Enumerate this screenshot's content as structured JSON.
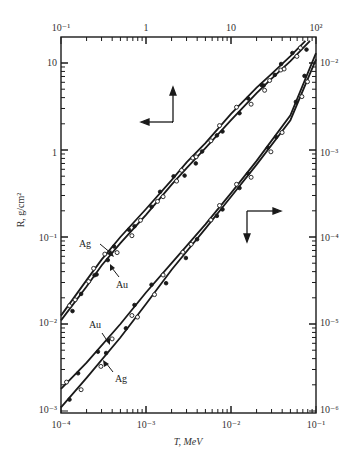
{
  "chart_data": {
    "type": "line",
    "title": "",
    "xlabel_top": "",
    "xlabel_bottom": "T, MeV",
    "ylabel_left": "R, g/cm²",
    "ylabel_right": "",
    "scale": "log-log",
    "grid": false,
    "axes": {
      "top_x": {
        "range": [
          0.1,
          100
        ],
        "ticks": [
          "10⁻¹",
          "1",
          "10",
          "10²"
        ]
      },
      "bottom_x": {
        "range": [
          0.0001,
          0.1
        ],
        "ticks": [
          "10⁻⁴",
          "10⁻³",
          "10⁻²",
          "10⁻¹"
        ]
      },
      "left_y": {
        "range": [
          0.001,
          20
        ],
        "ticks": [
          "10⁻³",
          "10⁻²",
          "10⁻¹",
          "1",
          "10"
        ]
      },
      "right_y": {
        "range": [
          1e-06,
          0.02
        ],
        "ticks": [
          "10⁻⁶",
          "10⁻⁵",
          "10⁻⁴",
          "10⁻³",
          "10⁻²"
        ]
      }
    },
    "axis_indicators": [
      {
        "group": "high-energy",
        "points_to": [
          "left axis",
          "top axis"
        ]
      },
      {
        "group": "low-energy",
        "points_to": [
          "right axis",
          "bottom axis"
        ]
      }
    ],
    "series": [
      {
        "name": "Ag (high energy)",
        "axes": "top-left",
        "label": "Ag",
        "x": [
          0.1,
          0.2,
          0.3,
          0.5,
          1,
          2,
          3,
          5,
          10,
          20,
          30,
          50,
          75
        ],
        "y": [
          0.0125,
          0.032,
          0.055,
          0.1,
          0.21,
          0.45,
          0.72,
          1.2,
          2.6,
          5.2,
          7.5,
          12,
          18
        ]
      },
      {
        "name": "Au (high energy)",
        "axes": "top-left",
        "label": "Au",
        "x": [
          0.1,
          0.2,
          0.3,
          0.5,
          1,
          2,
          3,
          5,
          10,
          20,
          30,
          50,
          85
        ],
        "y": [
          0.011,
          0.027,
          0.047,
          0.085,
          0.18,
          0.4,
          0.62,
          1.05,
          2.2,
          4.5,
          6.6,
          10.5,
          18
        ]
      },
      {
        "name": "Au (low energy)",
        "axes": "bottom-right",
        "label": "Au",
        "x": [
          0.0001,
          0.0002,
          0.0005,
          0.001,
          0.002,
          0.005,
          0.01,
          0.02,
          0.05,
          0.1
        ],
        "y": [
          1.8e-06,
          3.6e-06,
          1e-05,
          2.3e-05,
          5e-05,
          0.00014,
          0.00032,
          0.00075,
          0.0025,
          0.013
        ]
      },
      {
        "name": "Ag (low energy)",
        "axes": "bottom-right",
        "label": "Ag",
        "x": [
          0.0001,
          0.0002,
          0.0005,
          0.001,
          0.002,
          0.005,
          0.01,
          0.02,
          0.05,
          0.1
        ],
        "y": [
          1.1e-06,
          2.4e-06,
          7e-06,
          1.7e-05,
          4.2e-05,
          0.000125,
          0.00029,
          0.00068,
          0.0022,
          0.011
        ]
      }
    ],
    "annotations": [
      "Ag",
      "Au",
      "Au",
      "Ag"
    ],
    "experimental_points": "open and filled circles scattered along both curve pairs"
  },
  "labels": {
    "top_ticks": [
      "10⁻¹",
      "1",
      "10",
      "10²"
    ],
    "bottom_ticks": [
      "10⁻⁴",
      "10⁻³",
      "10⁻²",
      "10⁻¹"
    ],
    "left_ticks": [
      "10",
      "1",
      "10⁻¹",
      "10⁻²",
      "10⁻³"
    ],
    "right_ticks": [
      "10⁻²",
      "10⁻³",
      "10⁻⁴",
      "10⁻⁵",
      "10⁻⁶"
    ],
    "xlabel": "T, MeV",
    "ylabel": "R, g/cm²",
    "ann_ag_upper": "Ag",
    "ann_au_upper": "Au",
    "ann_au_lower": "Au",
    "ann_ag_lower": "Ag"
  },
  "colors": {
    "ink": "#1a1a1a",
    "background": "#ffffff"
  }
}
